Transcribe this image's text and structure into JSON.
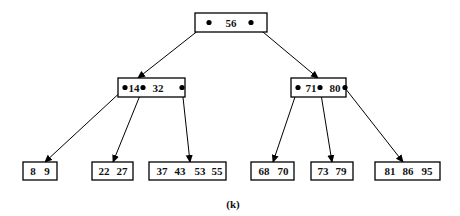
{
  "diagram": {
    "type": "b-tree",
    "caption": "(k)",
    "root": {
      "id": "root",
      "keys": [
        "56"
      ],
      "box": {
        "x": 195,
        "y": 13,
        "w": 72,
        "h": 19
      },
      "key_x": [
        231
      ],
      "pointers_x": [
        209,
        251
      ],
      "children": [
        "left",
        "right"
      ]
    },
    "internal": [
      {
        "id": "left",
        "keys": [
          "14",
          "32"
        ],
        "box": {
          "x": 118,
          "y": 78,
          "w": 67,
          "h": 19
        },
        "key_x": [
          134,
          158
        ],
        "pointers_x": [
          125,
          143,
          182
        ],
        "children": [
          "leaf0",
          "leaf1",
          "leaf2"
        ]
      },
      {
        "id": "right",
        "keys": [
          "71",
          "80"
        ],
        "box": {
          "x": 291,
          "y": 78,
          "w": 55,
          "h": 19
        },
        "key_x": [
          311,
          335
        ],
        "pointers_x": [
          298,
          320,
          345
        ],
        "children": [
          "leaf3",
          "leaf4",
          "leaf5"
        ]
      }
    ],
    "leaves": [
      {
        "id": "leaf0",
        "keys": [
          "8",
          "9"
        ],
        "box": {
          "x": 23,
          "y": 162,
          "w": 34,
          "h": 18
        },
        "key_x": [
          33,
          47
        ]
      },
      {
        "id": "leaf1",
        "keys": [
          "22",
          "27"
        ],
        "box": {
          "x": 92,
          "y": 162,
          "w": 41,
          "h": 18
        },
        "key_x": [
          104,
          122
        ]
      },
      {
        "id": "leaf2",
        "keys": [
          "37",
          "43",
          "53",
          "55"
        ],
        "box": {
          "x": 149,
          "y": 162,
          "w": 77,
          "h": 18
        },
        "key_x": [
          162,
          180,
          200,
          217
        ]
      },
      {
        "id": "leaf3",
        "keys": [
          "68",
          "70"
        ],
        "box": {
          "x": 251,
          "y": 162,
          "w": 43,
          "h": 18
        },
        "key_x": [
          264,
          283
        ]
      },
      {
        "id": "leaf4",
        "keys": [
          "73",
          "79"
        ],
        "box": {
          "x": 311,
          "y": 162,
          "w": 42,
          "h": 18
        },
        "key_x": [
          323,
          341
        ]
      },
      {
        "id": "leaf5",
        "keys": [
          "81",
          "86",
          "95"
        ],
        "box": {
          "x": 375,
          "y": 162,
          "w": 65,
          "h": 18
        },
        "key_x": [
          390,
          408,
          427
        ]
      }
    ],
    "edges": [
      {
        "from": "root",
        "from_x": 209,
        "from_y": 22,
        "to_x": 138,
        "to_y": 78
      },
      {
        "from": "root",
        "from_x": 251,
        "from_y": 22,
        "to_x": 318,
        "to_y": 78
      },
      {
        "from": "left",
        "from_x": 125,
        "from_y": 88,
        "to_x": 45,
        "to_y": 162
      },
      {
        "from": "left",
        "from_x": 143,
        "from_y": 88,
        "to_x": 113,
        "to_y": 162
      },
      {
        "from": "left",
        "from_x": 182,
        "from_y": 88,
        "to_x": 190,
        "to_y": 162
      },
      {
        "from": "right",
        "from_x": 298,
        "from_y": 88,
        "to_x": 273,
        "to_y": 162
      },
      {
        "from": "right",
        "from_x": 320,
        "from_y": 88,
        "to_x": 332,
        "to_y": 162
      },
      {
        "from": "right",
        "from_x": 345,
        "from_y": 88,
        "to_x": 403,
        "to_y": 162
      }
    ],
    "caption_pos": {
      "x": 233,
      "y": 208
    }
  }
}
